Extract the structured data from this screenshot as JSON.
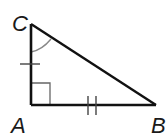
{
  "diagram": {
    "type": "right-triangle",
    "vertices": {
      "A": {
        "label": "A",
        "x": 31,
        "y": 105
      },
      "B": {
        "label": "B",
        "x": 156,
        "y": 105
      },
      "C": {
        "label": "C",
        "x": 31,
        "y": 24
      }
    },
    "markings": {
      "right_angle_at": "A",
      "angle_arc_at": "C",
      "side_CA_ticks": 1,
      "side_AB_ticks": 2
    },
    "colors": {
      "stroke": "#111111",
      "marking": "#555555",
      "arc": "#888888"
    }
  }
}
